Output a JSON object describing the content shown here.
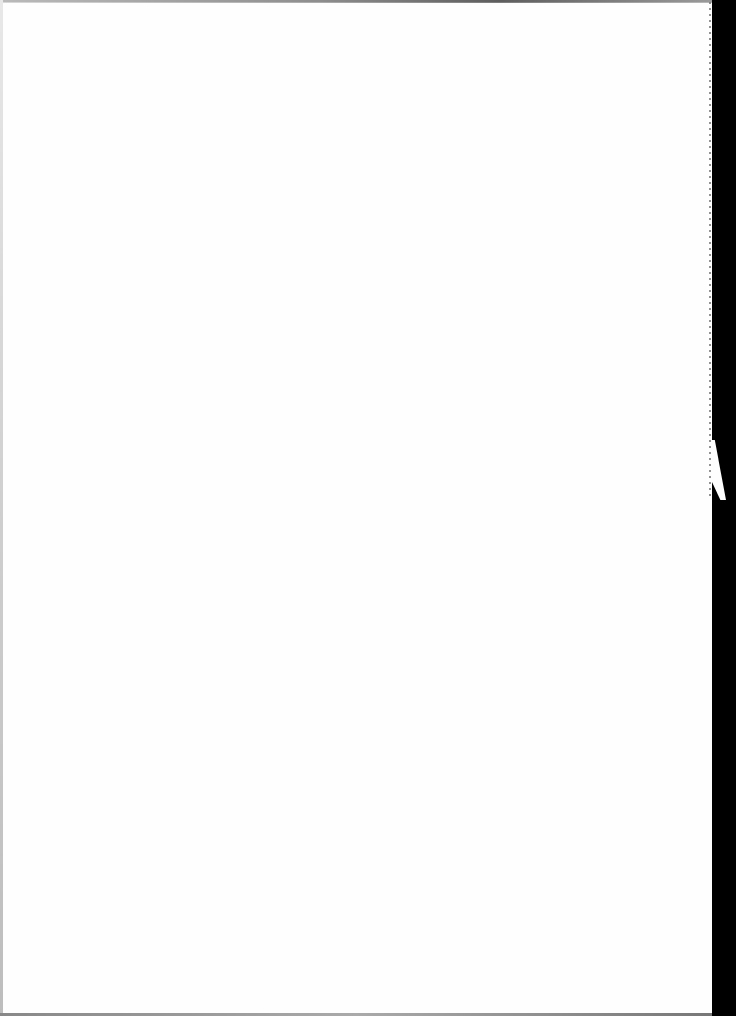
{
  "document": {
    "type": "scanned-page",
    "content": "",
    "page_background": "#fefefe",
    "scan_border_color": "#000000"
  }
}
